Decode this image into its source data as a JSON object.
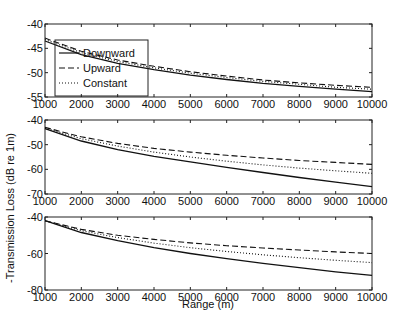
{
  "chart_data": [
    {
      "type": "line",
      "panel": 1,
      "title": "",
      "xlabel": "",
      "ylabel": "",
      "xlim": [
        1000,
        10000
      ],
      "ylim": [
        -55,
        -40
      ],
      "xticks": [
        1000,
        2000,
        3000,
        4000,
        5000,
        6000,
        7000,
        8000,
        9000,
        10000
      ],
      "yticks": [
        -55,
        -50,
        -45,
        -40
      ],
      "grid": false,
      "legend_position": "upper left (inset)",
      "x": [
        1000,
        2000,
        3000,
        4000,
        5000,
        6000,
        7000,
        8000,
        9000,
        10000
      ],
      "series": [
        {
          "name": "Downward",
          "style": "solid",
          "values": [
            -43.5,
            -46.3,
            -48.1,
            -49.4,
            -50.5,
            -51.4,
            -52.2,
            -52.8,
            -53.4,
            -53.9
          ]
        },
        {
          "name": "Upward",
          "style": "dashed",
          "values": [
            -42.9,
            -45.6,
            -47.4,
            -48.7,
            -49.8,
            -50.7,
            -51.5,
            -52.1,
            -52.6,
            -53.0
          ]
        },
        {
          "name": "Constant",
          "style": "dotted",
          "values": [
            -43.2,
            -45.9,
            -47.7,
            -49.0,
            -50.1,
            -51.0,
            -51.8,
            -52.4,
            -53.0,
            -53.4
          ]
        }
      ]
    },
    {
      "type": "line",
      "panel": 2,
      "title": "",
      "xlabel": "",
      "ylabel": "",
      "xlim": [
        1000,
        10000
      ],
      "ylim": [
        -70,
        -40
      ],
      "xticks": [
        1000,
        2000,
        3000,
        4000,
        5000,
        6000,
        7000,
        8000,
        9000,
        10000
      ],
      "yticks": [
        -70,
        -60,
        -50,
        -40
      ],
      "grid": false,
      "x": [
        1000,
        2000,
        3000,
        4000,
        5000,
        6000,
        7000,
        8000,
        9000,
        10000
      ],
      "series": [
        {
          "name": "Downward",
          "style": "solid",
          "values": [
            -43.5,
            -48.5,
            -52.0,
            -54.7,
            -57.0,
            -59.2,
            -61.3,
            -63.3,
            -65.2,
            -67.0
          ]
        },
        {
          "name": "Upward",
          "style": "dashed",
          "values": [
            -43.0,
            -46.8,
            -49.5,
            -51.5,
            -53.0,
            -54.3,
            -55.4,
            -56.4,
            -57.2,
            -58.0
          ]
        },
        {
          "name": "Constant",
          "style": "dotted",
          "values": [
            -43.3,
            -47.6,
            -50.6,
            -53.0,
            -55.0,
            -56.7,
            -58.2,
            -59.5,
            -60.6,
            -61.6
          ]
        }
      ]
    },
    {
      "type": "line",
      "panel": 3,
      "title": "",
      "xlabel": "Range (m)",
      "ylabel": "",
      "xlim": [
        1000,
        10000
      ],
      "ylim": [
        -80,
        -40
      ],
      "xticks": [
        1000,
        2000,
        3000,
        4000,
        5000,
        6000,
        7000,
        8000,
        9000,
        10000
      ],
      "yticks": [
        -80,
        -60,
        -40
      ],
      "grid": false,
      "x": [
        1000,
        2000,
        3000,
        4000,
        5000,
        6000,
        7000,
        8000,
        9000,
        10000
      ],
      "series": [
        {
          "name": "Downward",
          "style": "solid",
          "values": [
            -42.0,
            -48.5,
            -53.0,
            -56.8,
            -60.0,
            -62.8,
            -65.4,
            -67.8,
            -70.0,
            -72.0
          ]
        },
        {
          "name": "Upward",
          "style": "dashed",
          "values": [
            -42.0,
            -46.8,
            -50.0,
            -52.3,
            -54.2,
            -55.7,
            -57.0,
            -58.1,
            -59.1,
            -60.0
          ]
        },
        {
          "name": "Constant",
          "style": "dotted",
          "values": [
            -42.0,
            -47.5,
            -51.3,
            -54.3,
            -56.8,
            -58.9,
            -60.7,
            -62.3,
            -63.7,
            -65.0
          ]
        }
      ]
    }
  ],
  "figure": {
    "shared_ylabel": "-Transmission Loss (dB re 1m)",
    "shared_xlabel": "Range (m)",
    "legend": {
      "entries": [
        {
          "label": "Downward",
          "style": "solid"
        },
        {
          "label": "Upward",
          "style": "dashed"
        },
        {
          "label": "Constant",
          "style": "dotted"
        }
      ]
    },
    "colors": {
      "line": "#111111",
      "axis": "#222222",
      "background": "#ffffff"
    }
  }
}
